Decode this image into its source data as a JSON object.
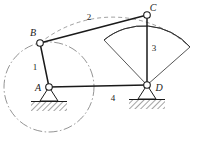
{
  "figure": {
    "type": "kinematic-linkage-diagram",
    "title": "",
    "background_color": "#ffffff",
    "line_color": "#1a1a1a",
    "construction_color": "#555555"
  },
  "joints": [
    {
      "id": "A",
      "label": "A",
      "x": 49,
      "y": 87,
      "kind": "fixed-pivot",
      "label_x": 38,
      "label_y": 91
    },
    {
      "id": "B",
      "label": "B",
      "x": 40,
      "y": 43,
      "kind": "revolute",
      "label_x": 33,
      "label_y": 36
    },
    {
      "id": "C",
      "label": "C",
      "x": 147,
      "y": 15,
      "kind": "revolute",
      "label_x": 153,
      "label_y": 11
    },
    {
      "id": "D",
      "label": "D",
      "x": 147,
      "y": 85,
      "kind": "fixed-pivot",
      "label_x": 157,
      "label_y": 91
    }
  ],
  "links": [
    {
      "id": "1",
      "label": "1",
      "from": "A",
      "to": "B",
      "role": "crank",
      "label_x": 35,
      "label_y": 70
    },
    {
      "id": "2",
      "label": "2",
      "from": "B",
      "to": "C",
      "role": "coupler",
      "label_x": 89,
      "label_y": 20
    },
    {
      "id": "3",
      "label": "3",
      "from": "C",
      "to": "D",
      "role": "rocker-sector",
      "label_x": 153,
      "label_y": 51
    },
    {
      "id": "4",
      "label": "4",
      "from": "A",
      "to": "D",
      "role": "ground-frame",
      "label_x": 113,
      "label_y": 101
    }
  ],
  "construction": {
    "crank_circle": {
      "center": "A",
      "center_x": 49,
      "center_y": 87,
      "radius": 45,
      "style": "dash-dot"
    },
    "coupler_arc": {
      "center_x": 147,
      "center_y": 85,
      "radius": 115,
      "style": "dashed"
    }
  },
  "ground_supports": [
    {
      "at": "A",
      "x": 49,
      "y": 87,
      "hatch_width": 36,
      "hatch_height": 9
    },
    {
      "at": "D",
      "x": 147,
      "y": 85,
      "hatch_width": 36,
      "hatch_height": 9
    }
  ],
  "sector": {
    "apex": "C",
    "pivot": "D",
    "left_vertex_x": 104,
    "left_vertex_y": 40,
    "right_vertex_x": 190,
    "right_vertex_y": 47
  }
}
